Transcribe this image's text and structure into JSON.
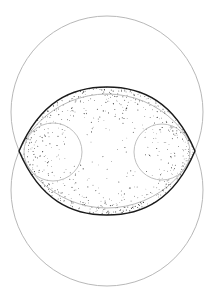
{
  "diagram": {
    "title": "",
    "colors": {
      "background": "#ffffff",
      "outer_circle_stroke": "#b8b8b8",
      "lens_outline": "#1a1a1a",
      "inner_circle_stroke": "#c0c0c0",
      "stipple": "#222222"
    },
    "elements": {
      "top_circle": {
        "cx": 107,
        "cy": 112,
        "r": 96
      },
      "bottom_circle": {
        "cx": 107,
        "cy": 190,
        "r": 96
      },
      "lens": {
        "left_x": 19,
        "right_x": 195,
        "mid_y": 151,
        "top_y": 87,
        "bottom_y": 215
      },
      "left_inner_circle": {
        "cx": 53,
        "cy": 152,
        "r": 29
      },
      "right_inner_circle": {
        "cx": 162,
        "cy": 152,
        "r": 28
      }
    }
  }
}
